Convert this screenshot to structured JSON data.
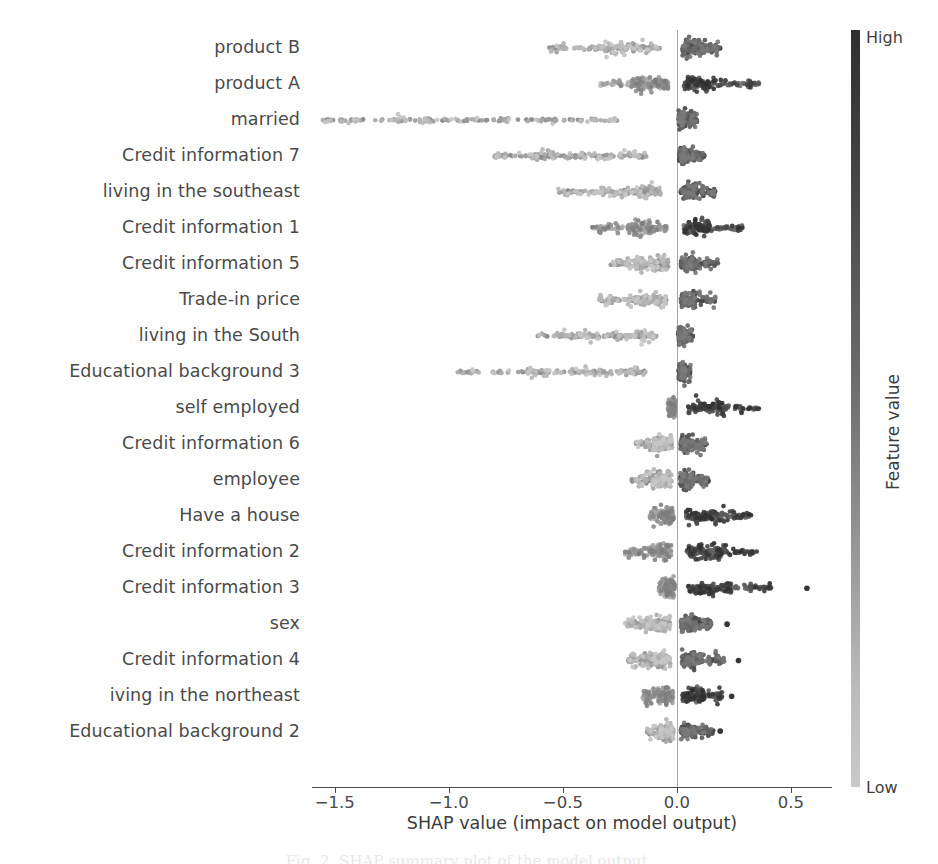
{
  "chart_data": {
    "type": "scatter",
    "plot_kind": "shap-beeswarm-summary",
    "title": "",
    "xlabel": "SHAP value (impact on model output)",
    "ylabel": "",
    "xlim": [
      -1.6,
      0.68
    ],
    "xticks": [
      -1.5,
      -1.0,
      -0.5,
      0.0,
      0.5
    ],
    "xticklabels": [
      "−1.5",
      "−1.0",
      "−0.5",
      "0.0",
      "0.5"
    ],
    "grid": false,
    "zero_reference_line": 0.0,
    "colorbar": {
      "title": "Feature value",
      "high_label": "High",
      "low_label": "Low",
      "high_color": "#2f2f2f",
      "low_color": "#c9c9c9",
      "position": "right"
    },
    "categories": [
      "product B",
      "product A",
      "married",
      "Credit information 7",
      "living in the southeast",
      "Credit information 1",
      "Credit information 5",
      "Trade-in price",
      "living in the South",
      "Educational background 3",
      "self employed",
      "Credit information 6",
      "employee",
      "Have a house",
      "Credit information 2",
      "Credit information 3",
      "sex",
      "Credit information 4",
      "iving in the northeast",
      "Educational background 2"
    ],
    "series": [
      {
        "name": "product B",
        "negative_tail": -0.56,
        "positive_tail": 0.19,
        "dense_core": [
          -0.3,
          0.1
        ],
        "high_value_side": "negative",
        "spread": 0.085,
        "n": 300
      },
      {
        "name": "product A",
        "negative_tail": -0.34,
        "positive_tail": 0.36,
        "dense_core": [
          -0.15,
          0.12
        ],
        "high_value_side": "positive",
        "spread": 0.08,
        "n": 300
      },
      {
        "name": "married",
        "negative_tail": -1.56,
        "positive_tail": 0.09,
        "dense_core": [
          -1.05,
          0.03
        ],
        "high_value_side": "negative",
        "spread": 0.04,
        "n": 300
      },
      {
        "name": "Credit information 7",
        "negative_tail": -0.8,
        "positive_tail": 0.12,
        "dense_core": [
          -0.52,
          0.04
        ],
        "high_value_side": "negative",
        "spread": 0.042,
        "n": 300
      },
      {
        "name": "living in the southeast",
        "negative_tail": -0.52,
        "positive_tail": 0.17,
        "dense_core": [
          -0.28,
          0.07
        ],
        "high_value_side": "negative",
        "spread": 0.055,
        "n": 300
      },
      {
        "name": "Credit information 1",
        "negative_tail": -0.38,
        "positive_tail": 0.29,
        "dense_core": [
          -0.18,
          0.12
        ],
        "high_value_side": "positive",
        "spread": 0.07,
        "n": 300
      },
      {
        "name": "Credit information 5",
        "negative_tail": -0.29,
        "positive_tail": 0.18,
        "dense_core": [
          -0.15,
          0.07
        ],
        "high_value_side": "negative",
        "spread": 0.05,
        "n": 300
      },
      {
        "name": "Trade-in price",
        "negative_tail": -0.34,
        "positive_tail": 0.17,
        "dense_core": [
          -0.18,
          0.07
        ],
        "high_value_side": "negative",
        "spread": 0.048,
        "n": 300
      },
      {
        "name": "living in the South",
        "negative_tail": -0.62,
        "positive_tail": 0.07,
        "dense_core": [
          -0.36,
          0.03
        ],
        "high_value_side": "negative",
        "spread": 0.032,
        "n": 300
      },
      {
        "name": "Educational background 3",
        "negative_tail": -0.97,
        "positive_tail": 0.06,
        "dense_core": [
          -0.55,
          0.03
        ],
        "high_value_side": "negative",
        "spread": 0.03,
        "n": 300
      },
      {
        "name": "self employed",
        "negative_tail": -0.04,
        "positive_tail": 0.36,
        "dense_core": [
          -0.02,
          0.18
        ],
        "high_value_side": "positive",
        "spread": 0.034,
        "n": 300
      },
      {
        "name": "Credit information 6",
        "negative_tail": -0.18,
        "positive_tail": 0.13,
        "dense_core": [
          -0.09,
          0.06
        ],
        "high_value_side": "negative",
        "spread": 0.044,
        "n": 300
      },
      {
        "name": "employee",
        "negative_tail": -0.2,
        "positive_tail": 0.14,
        "dense_core": [
          -0.09,
          0.06
        ],
        "high_value_side": "negative",
        "spread": 0.04,
        "n": 300
      },
      {
        "name": "Have a house",
        "negative_tail": -0.12,
        "positive_tail": 0.33,
        "dense_core": [
          -0.06,
          0.16
        ],
        "high_value_side": "positive",
        "spread": 0.036,
        "n": 300
      },
      {
        "name": "Credit information 2",
        "negative_tail": -0.23,
        "positive_tail": 0.35,
        "dense_core": [
          -0.1,
          0.17
        ],
        "high_value_side": "positive",
        "spread": 0.03,
        "n": 300
      },
      {
        "name": "Credit information 3",
        "negative_tail": -0.08,
        "positive_tail": 0.42,
        "dense_core": [
          -0.04,
          0.2
        ],
        "high_value_side": "positive",
        "spread": 0.028,
        "n": 300,
        "outliers": [
          0.57
        ]
      },
      {
        "name": "sex",
        "negative_tail": -0.23,
        "positive_tail": 0.15,
        "dense_core": [
          -0.11,
          0.07
        ],
        "high_value_side": "negative",
        "spread": 0.038,
        "n": 300,
        "outliers": [
          0.22
        ]
      },
      {
        "name": "Credit information 4",
        "negative_tail": -0.22,
        "positive_tail": 0.21,
        "dense_core": [
          -0.11,
          0.09
        ],
        "high_value_side": "negative",
        "spread": 0.034,
        "n": 300,
        "outliers": [
          0.27
        ]
      },
      {
        "name": "iving in the northeast",
        "negative_tail": -0.15,
        "positive_tail": 0.2,
        "dense_core": [
          -0.07,
          0.1
        ],
        "high_value_side": "positive",
        "spread": 0.03,
        "n": 300,
        "outliers": [
          0.24
        ]
      },
      {
        "name": "Educational background 2",
        "negative_tail": -0.13,
        "positive_tail": 0.16,
        "dense_core": [
          -0.06,
          0.07
        ],
        "high_value_side": "negative",
        "spread": 0.03,
        "n": 300,
        "outliers": [
          0.19
        ]
      }
    ]
  },
  "caption": {
    "text": "Fig. 2. SHAP summary plot of the model output."
  }
}
